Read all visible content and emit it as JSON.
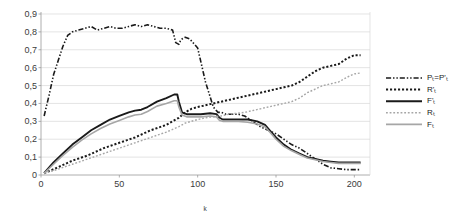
{
  "chart_data": {
    "type": "line",
    "title": "",
    "xlabel": "k",
    "ylabel": "",
    "xlim": [
      0,
      210
    ],
    "ylim": [
      0,
      0.9
    ],
    "grid": true,
    "legend_position": "right",
    "xticks": [
      "0",
      "50",
      "100",
      "150",
      "200"
    ],
    "xtick_values": [
      0,
      50,
      100,
      150,
      200
    ],
    "yticks": [
      "0",
      "0,1",
      "0,2",
      "0,3",
      "0,4",
      "0,5",
      "0,6",
      "0,7",
      "0,8",
      "0,9"
    ],
    "ytick_values": [
      0,
      0.1,
      0.2,
      0.3,
      0.4,
      0.5,
      0.6,
      0.7,
      0.8,
      0.9
    ],
    "series": [
      {
        "name": "P_T=P'_T",
        "label": "Pₜ=P'ₜ",
        "style": "dash-dot-dot",
        "color": "#1a1a1a",
        "width": 1.6,
        "x": [
          2,
          5,
          8,
          11,
          14,
          17,
          20,
          24,
          28,
          32,
          36,
          40,
          44,
          48,
          52,
          56,
          60,
          64,
          68,
          72,
          76,
          80,
          84,
          86,
          88,
          89,
          90,
          92,
          95,
          100,
          105,
          110,
          113,
          115,
          118,
          122,
          126,
          130,
          135,
          140,
          145,
          150,
          155,
          160,
          165,
          170,
          175,
          180,
          185,
          190,
          195,
          200,
          204
        ],
        "y": [
          0.33,
          0.44,
          0.56,
          0.64,
          0.72,
          0.78,
          0.8,
          0.81,
          0.82,
          0.83,
          0.81,
          0.82,
          0.83,
          0.82,
          0.82,
          0.83,
          0.84,
          0.83,
          0.84,
          0.83,
          0.82,
          0.82,
          0.81,
          0.74,
          0.73,
          0.75,
          0.76,
          0.77,
          0.76,
          0.71,
          0.52,
          0.38,
          0.35,
          0.35,
          0.34,
          0.34,
          0.34,
          0.33,
          0.3,
          0.27,
          0.25,
          0.23,
          0.2,
          0.17,
          0.15,
          0.12,
          0.09,
          0.06,
          0.04,
          0.035,
          0.03,
          0.03,
          0.03
        ]
      },
      {
        "name": "R'_T",
        "label": "R'ₜ",
        "style": "thick-dotted",
        "color": "#1a1a1a",
        "width": 2.0,
        "x": [
          2,
          10,
          20,
          30,
          40,
          50,
          60,
          70,
          80,
          88,
          92,
          96,
          100,
          105,
          110,
          115,
          120,
          125,
          130,
          135,
          140,
          145,
          150,
          155,
          160,
          165,
          170,
          175,
          180,
          185,
          190,
          195,
          200,
          204
        ],
        "y": [
          0.01,
          0.04,
          0.08,
          0.11,
          0.15,
          0.18,
          0.21,
          0.25,
          0.28,
          0.32,
          0.35,
          0.37,
          0.38,
          0.39,
          0.4,
          0.41,
          0.42,
          0.43,
          0.44,
          0.45,
          0.46,
          0.47,
          0.48,
          0.49,
          0.5,
          0.52,
          0.55,
          0.58,
          0.6,
          0.61,
          0.62,
          0.65,
          0.67,
          0.67
        ]
      },
      {
        "name": "F'_T",
        "label": "F'ₜ",
        "style": "solid",
        "color": "#1a1a1a",
        "width": 1.9,
        "x": [
          2,
          8,
          14,
          20,
          26,
          32,
          38,
          44,
          50,
          56,
          60,
          64,
          68,
          74,
          80,
          85,
          87,
          88,
          90,
          93,
          97,
          102,
          108,
          112,
          114,
          116,
          120,
          126,
          132,
          138,
          143,
          146,
          150,
          155,
          160,
          165,
          170,
          175,
          180,
          185,
          190,
          195,
          200,
          204
        ],
        "y": [
          0.01,
          0.07,
          0.12,
          0.17,
          0.21,
          0.25,
          0.28,
          0.31,
          0.33,
          0.35,
          0.36,
          0.365,
          0.38,
          0.41,
          0.43,
          0.45,
          0.45,
          0.41,
          0.35,
          0.34,
          0.34,
          0.34,
          0.345,
          0.34,
          0.32,
          0.31,
          0.31,
          0.31,
          0.31,
          0.3,
          0.28,
          0.25,
          0.21,
          0.17,
          0.14,
          0.12,
          0.1,
          0.09,
          0.08,
          0.075,
          0.07,
          0.07,
          0.07,
          0.07
        ]
      },
      {
        "name": "R_T",
        "label": "Rₜ",
        "style": "fine-dotted",
        "color": "#a6a6a6",
        "width": 1.4,
        "x": [
          2,
          10,
          20,
          30,
          40,
          50,
          60,
          70,
          80,
          88,
          92,
          96,
          100,
          105,
          110,
          115,
          120,
          125,
          130,
          135,
          140,
          145,
          150,
          155,
          160,
          165,
          170,
          175,
          180,
          185,
          190,
          195,
          200,
          204
        ],
        "y": [
          0.01,
          0.03,
          0.06,
          0.09,
          0.12,
          0.15,
          0.18,
          0.21,
          0.24,
          0.27,
          0.29,
          0.3,
          0.31,
          0.32,
          0.325,
          0.33,
          0.34,
          0.345,
          0.35,
          0.36,
          0.37,
          0.38,
          0.39,
          0.4,
          0.41,
          0.43,
          0.46,
          0.48,
          0.5,
          0.51,
          0.52,
          0.545,
          0.565,
          0.57
        ]
      },
      {
        "name": "F_T",
        "label": "Fₜ",
        "style": "solid",
        "color": "#a6a6a6",
        "width": 1.6,
        "x": [
          2,
          8,
          14,
          20,
          26,
          32,
          38,
          44,
          50,
          56,
          60,
          64,
          68,
          74,
          80,
          85,
          87,
          88,
          90,
          93,
          97,
          102,
          108,
          112,
          114,
          116,
          120,
          126,
          132,
          138,
          143,
          146,
          150,
          155,
          160,
          165,
          170,
          175,
          180,
          185,
          190,
          195,
          200,
          204
        ],
        "y": [
          0.01,
          0.06,
          0.11,
          0.155,
          0.195,
          0.23,
          0.26,
          0.285,
          0.305,
          0.325,
          0.335,
          0.34,
          0.355,
          0.385,
          0.4,
          0.415,
          0.415,
          0.38,
          0.335,
          0.325,
          0.325,
          0.325,
          0.33,
          0.325,
          0.305,
          0.3,
          0.3,
          0.3,
          0.295,
          0.285,
          0.27,
          0.24,
          0.2,
          0.16,
          0.135,
          0.115,
          0.095,
          0.085,
          0.075,
          0.07,
          0.065,
          0.065,
          0.065,
          0.065
        ]
      }
    ]
  }
}
